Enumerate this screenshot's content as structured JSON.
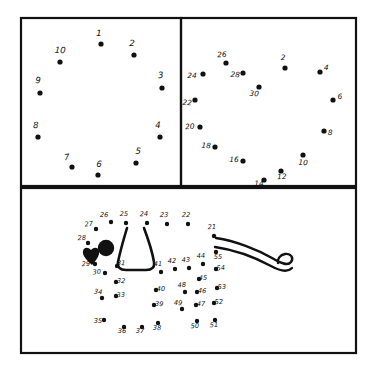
{
  "sheet": {
    "title": "Dot-to-dot puzzle worksheet",
    "background_color": "#ffffff",
    "ink_color": "#111111",
    "panel_count": 3
  },
  "panels": [
    {
      "id": "panel-top-left",
      "name": "circle-of-ten-dots",
      "description": "Ten numbered dots arranged in a circle",
      "x": 21,
      "y": 18,
      "width": 160,
      "height": 168,
      "dots": [
        {
          "label": "1",
          "x": 101,
          "y": 44,
          "lx": 99,
          "ly": 36
        },
        {
          "label": "2",
          "x": 134,
          "y": 55,
          "lx": 132,
          "ly": 46
        },
        {
          "label": "3",
          "x": 162,
          "y": 88,
          "lx": 161,
          "ly": 78
        },
        {
          "label": "4",
          "x": 160,
          "y": 137,
          "lx": 158,
          "ly": 128
        },
        {
          "label": "5",
          "x": 136,
          "y": 163,
          "lx": 138,
          "ly": 154
        },
        {
          "label": "6",
          "x": 98,
          "y": 175,
          "lx": 99,
          "ly": 167
        },
        {
          "label": "7",
          "x": 72,
          "y": 167,
          "lx": 67,
          "ly": 160
        },
        {
          "label": "8",
          "x": 38,
          "y": 137,
          "lx": 36,
          "ly": 128
        },
        {
          "label": "9",
          "x": 40,
          "y": 93,
          "lx": 38,
          "ly": 83
        },
        {
          "label": "10",
          "x": 60,
          "y": 62,
          "lx": 60,
          "ly": 53
        }
      ]
    },
    {
      "id": "panel-top-right",
      "name": "circle-of-even-dots",
      "description": "Fifteen dots labelled with even numbers 2 through 30 arranged in a circle",
      "x": 182,
      "y": 18,
      "width": 174,
      "height": 168,
      "dots": [
        {
          "label": "2",
          "x": 285,
          "y": 68,
          "lx": 283,
          "ly": 60
        },
        {
          "label": "4",
          "x": 320,
          "y": 72,
          "lx": 326,
          "ly": 70
        },
        {
          "label": "6",
          "x": 333,
          "y": 100,
          "lx": 340,
          "ly": 99
        },
        {
          "label": "8",
          "x": 324,
          "y": 131,
          "lx": 330,
          "ly": 135
        },
        {
          "label": "10",
          "x": 303,
          "y": 155,
          "lx": 303,
          "ly": 165
        },
        {
          "label": "12",
          "x": 281,
          "y": 171,
          "lx": 282,
          "ly": 179
        },
        {
          "label": "14",
          "x": 264,
          "y": 180,
          "lx": 259,
          "ly": 186
        },
        {
          "label": "16",
          "x": 243,
          "y": 161,
          "lx": 234,
          "ly": 162
        },
        {
          "label": "18",
          "x": 215,
          "y": 147,
          "lx": 206,
          "ly": 148
        },
        {
          "label": "20",
          "x": 200,
          "y": 127,
          "lx": 190,
          "ly": 129
        },
        {
          "label": "22",
          "x": 195,
          "y": 100,
          "lx": 187,
          "ly": 105
        },
        {
          "label": "24",
          "x": 203,
          "y": 74,
          "lx": 192,
          "ly": 78
        },
        {
          "label": "26",
          "x": 226,
          "y": 63,
          "lx": 222,
          "ly": 57
        },
        {
          "label": "28",
          "x": 243,
          "y": 73,
          "lx": 235,
          "ly": 77
        },
        {
          "label": "30",
          "x": 259,
          "y": 87,
          "lx": 254,
          "ly": 96
        }
      ]
    },
    {
      "id": "panel-bottom",
      "name": "dog-figure-dots",
      "description": "Dog or animal figure formed from dots numbered 21 through 55, with drawn ear, eye, nose and tail",
      "x": 21,
      "y": 188,
      "width": 335,
      "height": 165,
      "dots": [
        {
          "label": "21",
          "x": 214,
          "y": 236,
          "lx": 212,
          "ly": 229
        },
        {
          "label": "22",
          "x": 188,
          "y": 224,
          "lx": 186,
          "ly": 217
        },
        {
          "label": "23",
          "x": 167,
          "y": 224,
          "lx": 164,
          "ly": 217
        },
        {
          "label": "24",
          "x": 147,
          "y": 223,
          "lx": 144,
          "ly": 216
        },
        {
          "label": "25",
          "x": 126,
          "y": 223,
          "lx": 124,
          "ly": 216
        },
        {
          "label": "26",
          "x": 111,
          "y": 222,
          "lx": 104,
          "ly": 217
        },
        {
          "label": "27",
          "x": 96,
          "y": 229,
          "lx": 89,
          "ly": 226
        },
        {
          "label": "28",
          "x": 88,
          "y": 243,
          "lx": 82,
          "ly": 240
        },
        {
          "label": "29",
          "x": 95,
          "y": 264,
          "lx": 86,
          "ly": 266
        },
        {
          "label": "30",
          "x": 105,
          "y": 273,
          "lx": 97,
          "ly": 274
        },
        {
          "label": "31",
          "x": 117,
          "y": 266,
          "lx": 121,
          "ly": 265
        },
        {
          "label": "32",
          "x": 116,
          "y": 282,
          "lx": 121,
          "ly": 283
        },
        {
          "label": "33",
          "x": 116,
          "y": 296,
          "lx": 121,
          "ly": 297
        },
        {
          "label": "34",
          "x": 102,
          "y": 298,
          "lx": 98,
          "ly": 294
        },
        {
          "label": "35",
          "x": 104,
          "y": 320,
          "lx": 98,
          "ly": 323
        },
        {
          "label": "36",
          "x": 124,
          "y": 327,
          "lx": 122,
          "ly": 333
        },
        {
          "label": "37",
          "x": 142,
          "y": 327,
          "lx": 140,
          "ly": 333
        },
        {
          "label": "38",
          "x": 158,
          "y": 323,
          "lx": 157,
          "ly": 330
        },
        {
          "label": "39",
          "x": 154,
          "y": 305,
          "lx": 159,
          "ly": 306
        },
        {
          "label": "40",
          "x": 156,
          "y": 290,
          "lx": 161,
          "ly": 291
        },
        {
          "label": "41",
          "x": 161,
          "y": 272,
          "lx": 158,
          "ly": 266
        },
        {
          "label": "42",
          "x": 175,
          "y": 269,
          "lx": 172,
          "ly": 263
        },
        {
          "label": "43",
          "x": 189,
          "y": 268,
          "lx": 186,
          "ly": 262
        },
        {
          "label": "44",
          "x": 203,
          "y": 264,
          "lx": 201,
          "ly": 258
        },
        {
          "label": "45",
          "x": 199,
          "y": 279,
          "lx": 203,
          "ly": 280
        },
        {
          "label": "46",
          "x": 197,
          "y": 292,
          "lx": 202,
          "ly": 293
        },
        {
          "label": "47",
          "x": 196,
          "y": 305,
          "lx": 201,
          "ly": 306
        },
        {
          "label": "48",
          "x": 185,
          "y": 292,
          "lx": 182,
          "ly": 287
        },
        {
          "label": "49",
          "x": 182,
          "y": 309,
          "lx": 178,
          "ly": 305
        },
        {
          "label": "50",
          "x": 197,
          "y": 321,
          "lx": 195,
          "ly": 328
        },
        {
          "label": "51",
          "x": 215,
          "y": 320,
          "lx": 214,
          "ly": 327
        },
        {
          "label": "52",
          "x": 214,
          "y": 303,
          "lx": 219,
          "ly": 304
        },
        {
          "label": "53",
          "x": 217,
          "y": 288,
          "lx": 222,
          "ly": 289
        },
        {
          "label": "54",
          "x": 216,
          "y": 269,
          "lx": 221,
          "ly": 270
        },
        {
          "label": "55",
          "x": 216,
          "y": 252,
          "lx": 218,
          "ly": 259
        }
      ],
      "shapes": [
        {
          "name": "eye-blob",
          "type": "circle",
          "cx": 106,
          "cy": 248,
          "r": 8
        },
        {
          "name": "nose-blob",
          "type": "heart",
          "cx": 92,
          "cy": 255,
          "r": 9
        },
        {
          "name": "ear-outline",
          "type": "path"
        },
        {
          "name": "tail-outline",
          "type": "path"
        }
      ]
    }
  ]
}
